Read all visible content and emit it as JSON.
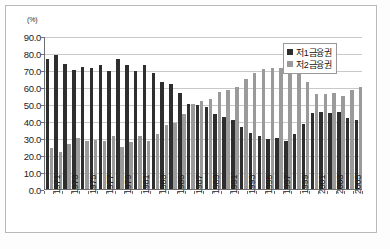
{
  "chart_data": {
    "type": "bar",
    "title": "",
    "subtitle": "",
    "unit_label": "(%)",
    "xlabel": "",
    "ylabel": "",
    "ylim": [
      0.0,
      90.0
    ],
    "ytick_step": 10.0,
    "ytick_labels": [
      "90.0",
      "80.0",
      "70.0",
      "60.0",
      "50.0",
      "40.0",
      "30.0",
      "20.0",
      "10.0",
      "0.0"
    ],
    "grid": true,
    "legend_position": "top-right",
    "categories": [
      "1971",
      "1972",
      "1973",
      "1974",
      "1975",
      "1976",
      "1977",
      "1978",
      "1979",
      "1980",
      "1981",
      "1982",
      "1983",
      "1984",
      "1985",
      "1986",
      "1987",
      "1988",
      "1989",
      "1990",
      "1991",
      "1992",
      "1993",
      "1994",
      "1995",
      "1996",
      "1997",
      "1998",
      "1999",
      "2000",
      "2001",
      "2002",
      "2003",
      "2004",
      "2005",
      "2006"
    ],
    "xtick_labels_shown": [
      "1971",
      "1973",
      "1975",
      "1977",
      "1979",
      "1981",
      "1983",
      "1985",
      "1987",
      "1989",
      "1991",
      "1993",
      "1995",
      "1997",
      "1999",
      "2001",
      "2003",
      "2005"
    ],
    "series": [
      {
        "name": "저1금융권",
        "color": "#2e2e2e",
        "values": [
          76.5,
          79.0,
          73.5,
          70.0,
          72.0,
          71.0,
          73.0,
          69.5,
          76.5,
          73.0,
          69.5,
          73.0,
          68.0,
          63.0,
          61.5,
          56.5,
          50.0,
          49.5,
          48.5,
          44.0,
          42.5,
          40.5,
          36.5,
          33.0,
          31.0,
          29.5,
          30.0,
          28.5,
          32.5,
          38.0,
          44.5,
          45.5,
          44.5,
          45.5,
          41.5,
          40.5
        ]
      },
      {
        "name": "저2금융권",
        "color": "#9a9a9a",
        "values": [
          24.0,
          21.5,
          26.5,
          30.0,
          28.5,
          29.0,
          28.0,
          31.0,
          24.5,
          27.5,
          31.0,
          28.5,
          32.5,
          37.5,
          39.0,
          44.0,
          50.0,
          52.0,
          53.0,
          57.0,
          58.0,
          60.0,
          64.5,
          68.0,
          70.5,
          71.0,
          71.0,
          73.0,
          68.5,
          63.0,
          56.0,
          56.0,
          56.5,
          55.0,
          58.5,
          60.0
        ]
      }
    ]
  },
  "legend": {
    "items": [
      {
        "label": "저1금융권",
        "swatch": "s1"
      },
      {
        "label": "저2금융권",
        "swatch": "s2"
      }
    ]
  }
}
